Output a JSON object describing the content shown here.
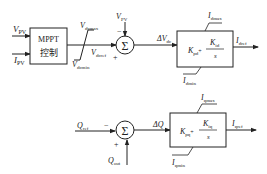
{
  "diagram": {
    "top_loop": {
      "inputs": {
        "vpv": {
          "main": "V",
          "sub": "PV"
        },
        "ipv": {
          "main": "I",
          "sub": "PV"
        }
      },
      "mppt_block": {
        "line1": "MPPT",
        "line2": "控制"
      },
      "limiter": {
        "upper": {
          "main": "V",
          "sub": "dcmax"
        },
        "lower": {
          "main": "V",
          "sub": "dcmin"
        }
      },
      "limiter_output": {
        "main": "V",
        "sub": "dcref"
      },
      "sum": {
        "symbol": "Σ",
        "minus_sign": "−",
        "plus_sign": "+"
      },
      "feedback": {
        "main": "V",
        "sub": "PV"
      },
      "error": {
        "prefix": "ΔV",
        "sub": "dc"
      },
      "pi_block": {
        "kp": {
          "main": "K",
          "sub": "pd"
        },
        "plus": "+",
        "ki": {
          "main": "K",
          "sub": "id"
        },
        "den": "s",
        "upper": {
          "main": "I",
          "sub": "dmax"
        },
        "lower": {
          "main": "I",
          "sub": "dmin"
        }
      },
      "output": {
        "main": "I",
        "sub": "dref"
      }
    },
    "bottom_loop": {
      "input": {
        "main": "Q",
        "sub": "ref"
      },
      "sum": {
        "symbol": "Σ",
        "minus_sign": "−",
        "plus_sign": "+"
      },
      "feedback": {
        "main": "Q",
        "sub": "out"
      },
      "error": {
        "text": "ΔQ"
      },
      "pi_block": {
        "kp": {
          "main": "K",
          "sub": "pq"
        },
        "plus": "+",
        "ki": {
          "main": "K",
          "sub": "iq"
        },
        "den": "s",
        "upper": {
          "main": "I",
          "sub": "qmax"
        },
        "lower": {
          "main": "I",
          "sub": "qmin"
        }
      },
      "output": {
        "main": "I",
        "sub": "qref"
      }
    }
  }
}
